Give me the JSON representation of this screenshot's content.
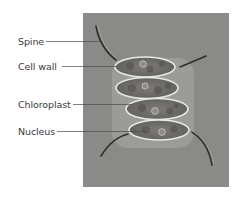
{
  "figure": {
    "background_color": "#8a8a88",
    "labels": [
      {
        "text": "Spine",
        "x": 18,
        "y": 36,
        "line_to": [
          110,
          41
        ]
      },
      {
        "text": "Cell wall",
        "x": 18,
        "y": 61,
        "line_to": [
          117,
          66
        ]
      },
      {
        "text": "Chloroplast",
        "x": 18,
        "y": 99,
        "line_to": [
          132,
          104
        ]
      },
      {
        "text": "Nucleus",
        "x": 18,
        "y": 126,
        "line_to": [
          146,
          131
        ]
      }
    ]
  }
}
